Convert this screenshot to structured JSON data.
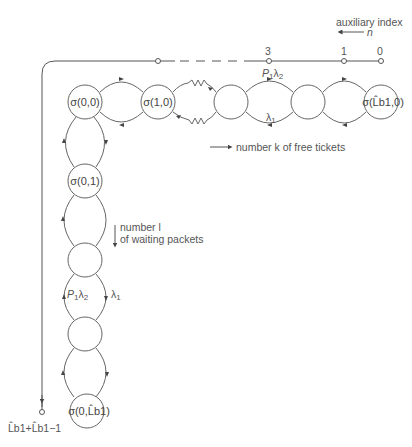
{
  "axis_top": {
    "title": "auxiliary index",
    "variable": "n",
    "ticks": [
      "3",
      "1",
      "0"
    ]
  },
  "axis_left": {
    "end_label": "L̂b1+L̂b1−1"
  },
  "states_horizontal": [
    {
      "label": "σ(0,0)"
    },
    {
      "label": "σ(1,0)"
    },
    {
      "label": ""
    },
    {
      "label": ""
    },
    {
      "label": "σ(L̂b1,0)"
    }
  ],
  "states_vertical": [
    {
      "label": "σ(0,1)"
    },
    {
      "label": ""
    },
    {
      "label": ""
    },
    {
      "label": "σ(0,L̂b1)"
    }
  ],
  "transitions": {
    "forward_rate": "P1λ2",
    "backward_rate": "λ1"
  },
  "annotations": {
    "free_tickets": "number k of free tickets",
    "waiting_packets_line1": "number l",
    "waiting_packets_line2": "of waiting packets"
  }
}
